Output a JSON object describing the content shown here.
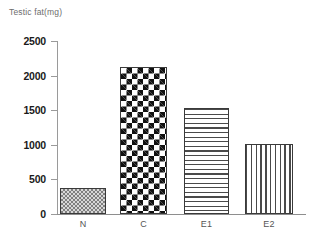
{
  "chart_data": {
    "type": "bar",
    "title": "Testic fat(mg)",
    "xlabel": "",
    "ylabel": "",
    "categories": [
      "N",
      "C",
      "E1",
      "E2"
    ],
    "values": [
      375,
      2125,
      1530,
      1010
    ],
    "ylim": [
      0,
      2500
    ],
    "yticks": [
      0,
      500,
      1000,
      1500,
      2000,
      2500
    ],
    "ytick_labels": [
      "0",
      "500",
      "1000",
      "1500",
      "2000",
      "2500"
    ],
    "grid": false,
    "legend": "none",
    "bar_patterns": [
      "fine-checkerboard",
      "bold-checkerboard",
      "horizontal-lines",
      "vertical-lines"
    ],
    "colors": {
      "axis": "#9a9a9a",
      "tick_text": "#1a1a1a",
      "category_text": "#555555",
      "title_text": "#6d6d6d",
      "bar_outline": "#3a3a3a",
      "background": "#ffffff"
    }
  }
}
